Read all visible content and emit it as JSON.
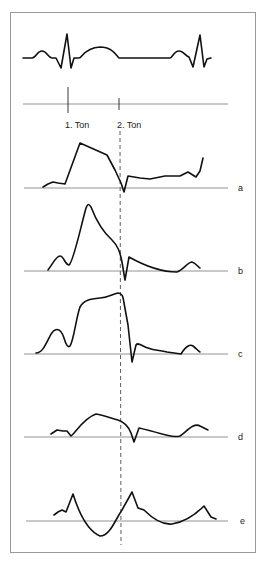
{
  "figure": {
    "frame_color": "#9a9a9a",
    "trace_color": "#111111",
    "markers": {
      "first_tone": "1. Ton",
      "second_tone": "2. Ton"
    },
    "curves": [
      {
        "id": "a",
        "label": "a"
      },
      {
        "id": "b",
        "label": "b"
      },
      {
        "id": "c",
        "label": "c"
      },
      {
        "id": "d",
        "label": "d"
      },
      {
        "id": "e",
        "label": "e"
      }
    ],
    "ecg": {
      "label": ""
    }
  }
}
